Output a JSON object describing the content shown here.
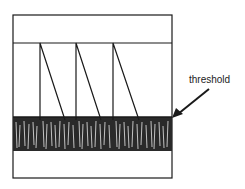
{
  "diagram": {
    "annotation": "threshold",
    "spikes": 3,
    "colors": {
      "ink": "#1a1a1a",
      "background": "#ffffff"
    }
  }
}
